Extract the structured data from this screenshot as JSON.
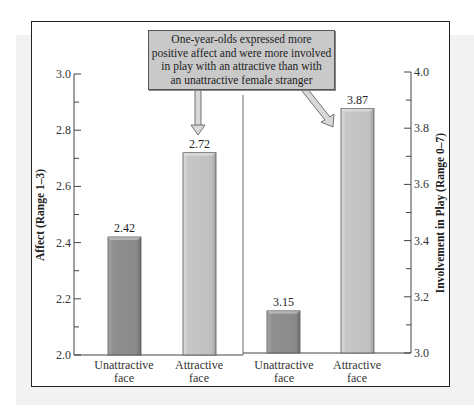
{
  "callout": {
    "lines": [
      "One-year-olds expressed more",
      "positive affect and were more involved",
      "in play with an attractive than with",
      "an unattractive female stranger"
    ]
  },
  "colors": {
    "unattractive_bar": "#8f8f8f",
    "attractive_bar": "#c4c4c4",
    "callout_fill": "#c9c9c9",
    "backdrop": "#f2f2f2"
  },
  "chart_data": [
    {
      "type": "bar",
      "title": "",
      "categories": [
        "Unattractive face",
        "Attractive face"
      ],
      "values": [
        2.42,
        2.72
      ],
      "xlabel": "",
      "ylabel": "Affect (Range 1–3)",
      "ylim": [
        2.0,
        3.0
      ],
      "yticks": [
        "2.0",
        "2.2",
        "2.4",
        "2.6",
        "2.8",
        "3.0"
      ],
      "value_labels": [
        "2.42",
        "2.72"
      ],
      "axis_side": "left",
      "grid": false
    },
    {
      "type": "bar",
      "title": "",
      "categories": [
        "Unattractive face",
        "Attractive face"
      ],
      "values": [
        3.15,
        3.87
      ],
      "xlabel": "",
      "ylabel": "Involvement in Play (Range 0–7)",
      "ylim": [
        3.0,
        4.0
      ],
      "yticks": [
        "3.0",
        "3.2",
        "3.4",
        "3.6",
        "3.8",
        "4.0"
      ],
      "value_labels": [
        "3.15",
        "3.87"
      ],
      "axis_side": "right",
      "grid": false
    }
  ],
  "annotation": "One-year-olds expressed more positive affect and were more involved in play with an attractive than with an unattractive female stranger",
  "category_lines": {
    "unattractive": [
      "Unattractive",
      "face"
    ],
    "attractive": [
      "Attractive",
      "face"
    ]
  }
}
